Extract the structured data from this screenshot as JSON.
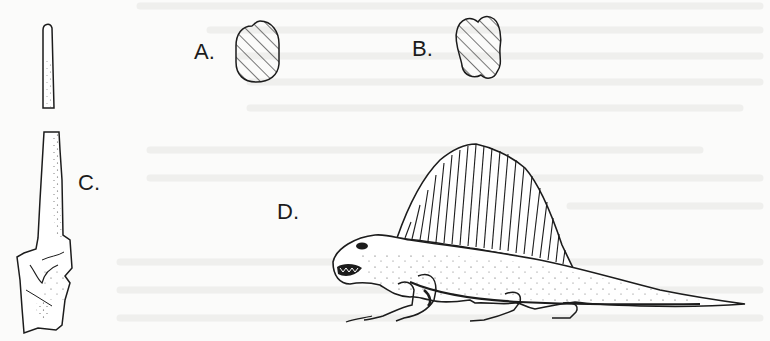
{
  "figure": {
    "panels": [
      {
        "id": "A",
        "label": "A.",
        "subject": "hatched-cross-section-rounded"
      },
      {
        "id": "B",
        "label": "B.",
        "subject": "hatched-cross-section-bilobed"
      },
      {
        "id": "C",
        "label": "C.",
        "subject": "neural-spine-bone"
      },
      {
        "id": "D",
        "label": "D.",
        "subject": "sail-backed-reptile-dimetrodon"
      }
    ]
  },
  "colors": {
    "ink": "#1c1c1c",
    "paper": "#fbfbfa",
    "bleed_through": "#ececea"
  }
}
